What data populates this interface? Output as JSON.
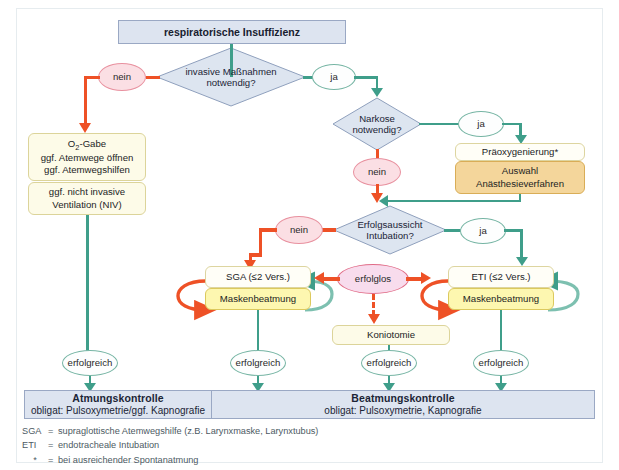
{
  "header": {
    "title": "respiratorische Insuffizienz"
  },
  "decisions": [
    {
      "id": "invasive",
      "line1": "invasive Maßnahmen",
      "line2": "notwendig?"
    },
    {
      "id": "narkose",
      "line1": "Narkose",
      "line2": "notwendig?"
    },
    {
      "id": "intubation",
      "line1": "Erfolgsaussicht",
      "line2": "Intubation?"
    }
  ],
  "labels": {
    "nein": "nein",
    "ja": "ja",
    "erfolglos": "erfolglos",
    "erfolgreich": "erfolgreich"
  },
  "boxes": {
    "o2_line1": "O",
    "o2_sub": "2",
    "o2_line1b": "-Gabe",
    "o2_line2": "ggf. Atemwege öffnen",
    "o2_line3": "ggf. Atemwegshilfen",
    "niv_line1": "ggf. nicht invasive",
    "niv_line2": "Ventilation (NIV)",
    "praeox": "Präoxygenierung*",
    "auswahl_line1": "Auswahl",
    "auswahl_line2": "Anästhesieverfahren",
    "sga": "SGA (≤2 Vers.)",
    "eti": "ETI (≤2 Vers.)",
    "masken_left": "Maskenbeatmung",
    "masken_right": "Maskenbeatmung",
    "koniotomie": "Koniotomie"
  },
  "result_bars": [
    {
      "title": "Atmungskontrolle",
      "subtitle": "obligat: Pulsoxymetrie/ggf. Kapnografie"
    },
    {
      "title": "Beatmungskontrolle",
      "subtitle": "obligat: Pulsoxymetrie, Kapnografie"
    }
  ],
  "footnotes": [
    {
      "key": "SGA",
      "eq": "=",
      "text": "supraglottische Atemwegshilfe (z.B. Larynxmaske, Larynxtubus)"
    },
    {
      "key": "ETI",
      "eq": "=",
      "text": "endotracheale Intubation"
    },
    {
      "key": "*",
      "eq": "=",
      "text": "bei ausreichender Spontanatmung"
    }
  ],
  "colors": {
    "green": "#3f9e8a",
    "red": "#ee5126",
    "bar_blue": "#dde4f0",
    "bar_blue_border": "#9aa8c4",
    "diamond_fill": "#dde5f0",
    "diamond_border": "#8fa0bd",
    "ellipse_red_fill": "#fbdfe4",
    "ellipse_red_border": "#e8919f",
    "ellipse_pink_fill": "#f8dced",
    "ellipse_pink_border": "#e06b86",
    "ellipse_green_border": "#76b5a4",
    "box_cream": "#fdfbe8",
    "box_yellow": "#fbf27f",
    "box_tan": "#f4d69b"
  }
}
